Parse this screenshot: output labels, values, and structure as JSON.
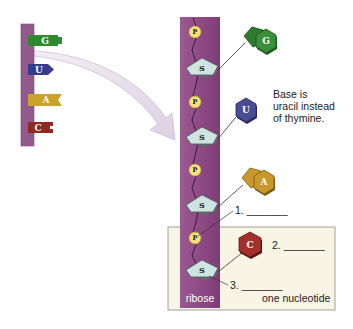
{
  "mini_strand": {
    "tabs": [
      {
        "letter": "G",
        "color": "#2f8a2f"
      },
      {
        "letter": "U",
        "color": "#3a3f8f"
      },
      {
        "letter": "A",
        "color": "#c9a22a"
      },
      {
        "letter": "C",
        "color": "#8e2a22"
      }
    ],
    "backbone_color": "#8a4d82"
  },
  "main_strand": {
    "backbone_color": "#8f4a85",
    "phosphate_label": "P",
    "sugar_label": "S",
    "sugar_name": "ribose",
    "nucleotides": [
      {
        "base": "G",
        "type": "purine",
        "color": "#3a8f3a"
      },
      {
        "base": "U",
        "type": "pyrimidine",
        "color": "#4a4c94"
      },
      {
        "base": "A",
        "type": "purine",
        "color": "#c9982c"
      },
      {
        "base": "C",
        "type": "pyrimidine",
        "color": "#a3302a"
      }
    ]
  },
  "annotations": {
    "uracil_note_line1": "Base is",
    "uracil_note_line2": "uracil instead",
    "uracil_note_line3": "of thymine.",
    "blank1": "1. _______",
    "blank2": "2. _______",
    "blank3": "3. _______",
    "nucleotide_box_label": "one nucleotide"
  },
  "colors": {
    "nucleotide_box_bg": "#f8f4e6",
    "phosphate_fill": "#f3e27a",
    "sugar_fill": "#cfe3e0",
    "arrow_fill": "#e6dcea"
  }
}
